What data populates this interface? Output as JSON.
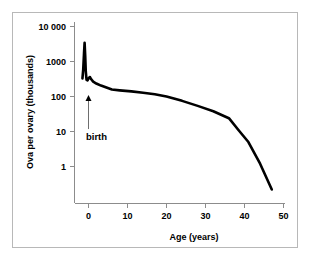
{
  "chart_data": {
    "type": "line",
    "title": "",
    "subtitle": "",
    "xlabel": "Age (years)",
    "ylabel": "Ova per ovary (thousands)",
    "yscale": "log",
    "xscale": "linear",
    "xlim": [
      -2,
      50
    ],
    "ylim": [
      0.1,
      10000
    ],
    "grid": false,
    "legend": null,
    "x_ticks": [
      0,
      10,
      20,
      30,
      40,
      50
    ],
    "x_tick_labels": [
      "0",
      "10",
      "20",
      "30",
      "40",
      "50"
    ],
    "y_ticks": [
      1,
      10,
      100,
      1000,
      10000
    ],
    "y_tick_labels": [
      "1",
      "10",
      "100",
      "1000",
      "10 000"
    ],
    "series": [
      {
        "name": "Ova per ovary",
        "color": "#000000",
        "x": [
          -1.55,
          -1.35,
          -1.15,
          -1.0,
          -0.85,
          -0.7,
          -0.5,
          -0.25,
          0.0,
          0.35,
          0.7,
          1.2,
          2.0,
          3.2,
          4.6,
          6.0,
          8.0,
          11.0,
          14.0,
          17.0,
          20.0,
          24.0,
          28.0,
          32.0,
          36.0,
          38.6,
          41.0,
          44.0,
          47.0
        ],
        "y": [
          330,
          600,
          1700,
          3400,
          1500,
          520,
          300,
          290,
          330,
          360,
          310,
          265,
          235,
          205,
          180,
          158,
          150,
          140,
          128,
          116,
          100,
          75,
          54,
          38,
          24,
          10.5,
          5.0,
          1.2,
          0.22
        ]
      }
    ],
    "annotations": [
      {
        "label": "birth",
        "x": 0,
        "y": 110,
        "type": "arrow-up",
        "arrow_color": "#6e6e6e",
        "text_color": "#000000"
      }
    ]
  },
  "figure": {
    "background_color": "#ffffff",
    "frame_color": "#b8b8b8",
    "axis_color": "#8c8c8c",
    "curve_color": "#000000"
  }
}
